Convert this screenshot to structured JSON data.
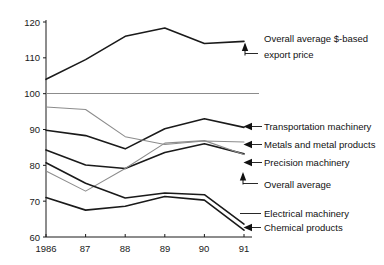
{
  "chart_data": {
    "type": "line",
    "title": "",
    "xlabel": "",
    "ylabel": "",
    "x": [
      "1986",
      "87",
      "88",
      "89",
      "90",
      "91"
    ],
    "xtick_labels": [
      "1986",
      "87",
      "88",
      "89",
      "90",
      "91"
    ],
    "ytick_labels": [
      "120",
      "110",
      "100",
      "90",
      "80",
      "70",
      "60"
    ],
    "ylim": [
      60,
      120
    ],
    "yticks": [
      60,
      70,
      80,
      90,
      100,
      110,
      120
    ],
    "grid": false,
    "legend_position": "right-inline-annotations",
    "reference_line": {
      "value": 100,
      "color": "#8c8c8c"
    },
    "series": [
      {
        "name": "Overall average $-based export price",
        "values": [
          104.0,
          109.5,
          116.0,
          118.3,
          114.0,
          114.6
        ],
        "color": "#1a1a1a",
        "style": "solid",
        "width": 1.6
      },
      {
        "name": "Transportation machinery",
        "values": [
          89.8,
          88.3,
          84.6,
          90.2,
          93.0,
          90.6
        ],
        "color": "#1a1a1a",
        "style": "solid",
        "width": 1.6
      },
      {
        "name": "Metals and metal products",
        "values": [
          96.3,
          95.6,
          88.0,
          85.8,
          86.8,
          86.5
        ],
        "color": "#8c8c8c",
        "style": "solid",
        "width": 1.1
      },
      {
        "name": "Precision machinery",
        "values": [
          84.3,
          80.1,
          79.1,
          83.6,
          86.0,
          83.2
        ],
        "color": "#1a1a1a",
        "style": "solid",
        "width": 1.6
      },
      {
        "name": "Overall average",
        "values": [
          78.4,
          72.8,
          79.1,
          86.2,
          86.9,
          83.0
        ],
        "color": "#8c8c8c",
        "style": "solid",
        "width": 1.1
      },
      {
        "name": "Electrical machinery",
        "values": [
          80.7,
          75.0,
          70.9,
          72.3,
          71.8,
          63.6
        ],
        "color": "#1a1a1a",
        "style": "solid",
        "width": 1.6
      },
      {
        "name": "Chemical products",
        "values": [
          71.0,
          67.5,
          68.6,
          71.3,
          70.3,
          61.9
        ],
        "color": "#1a1a1a",
        "style": "solid",
        "width": 1.6
      }
    ],
    "annotations": [
      {
        "id": "a-overall-dollar",
        "label_line1": "Overall average $-based",
        "label_line2": "export price",
        "marker": "arrow-up"
      },
      {
        "id": "a-transportation",
        "label_line1": "Transportation machinery",
        "label_line2": "",
        "marker": "arrow-left"
      },
      {
        "id": "a-metals",
        "label_line1": "Metals and metal products",
        "label_line2": "",
        "marker": "arrow-left"
      },
      {
        "id": "a-precision",
        "label_line1": "Precision machinery",
        "label_line2": "",
        "marker": "arrow-left"
      },
      {
        "id": "a-overall-average",
        "label_line1": "Overall average",
        "label_line2": "",
        "marker": "arrow-up"
      },
      {
        "id": "a-electrical",
        "label_line1": "Electrical machinery",
        "label_line2": "",
        "marker": "leader-line"
      },
      {
        "id": "a-chemical",
        "label_line1": "Chemical products",
        "label_line2": "",
        "marker": "arrow-left"
      }
    ],
    "colors": {
      "axis": "#1a1a1a",
      "dark_series": "#1a1a1a",
      "light_series": "#8c8c8c",
      "background": "#ffffff",
      "text": "#111111"
    }
  }
}
